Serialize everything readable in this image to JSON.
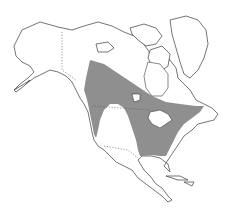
{
  "map": {
    "type": "species range map",
    "region": "North America",
    "colors": {
      "range_fill": "#8f8f8f",
      "land_fill": "#ffffff",
      "outline": "#3a3a3a",
      "background": "#ffffff"
    },
    "features": [
      "land-outline",
      "range-shading",
      "political-borders-dotted",
      "great-lakes",
      "greenland",
      "arctic-islands"
    ]
  }
}
